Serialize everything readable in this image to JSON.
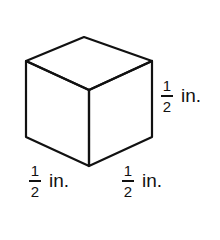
{
  "figure": {
    "shape": "cube",
    "stroke_color": "#111111",
    "background": "#ffffff"
  },
  "labels": {
    "height": {
      "numerator": "1",
      "denominator": "2",
      "unit": "in."
    },
    "width": {
      "numerator": "1",
      "denominator": "2",
      "unit": "in."
    },
    "depth": {
      "numerator": "1",
      "denominator": "2",
      "unit": "in."
    }
  }
}
